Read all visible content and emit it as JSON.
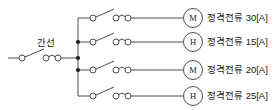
{
  "diagram": {
    "stroke_color": "#3a3a3a",
    "text_color": "#1a1a1a",
    "background": "#ffffff",
    "bus_label": "간선",
    "branches": [
      {
        "symbol": "M",
        "symbol_meaning": "motor",
        "label_prefix": "정격전류",
        "current": "30",
        "unit": "[A]",
        "label_full": "정격전류 30[A]"
      },
      {
        "symbol": "H",
        "symbol_meaning": "heater",
        "label_prefix": "정격전류",
        "current": "15",
        "unit": "[A]",
        "label_full": "정격전류 15[A]"
      },
      {
        "symbol": "M",
        "symbol_meaning": "motor",
        "label_prefix": "정격전류",
        "current": "20",
        "unit": "[A]",
        "label_full": "정격전류 20[A]"
      },
      {
        "symbol": "H",
        "symbol_meaning": "heater",
        "label_prefix": "정격전류",
        "current": "25",
        "unit": "[A]",
        "label_full": "정격전류 25[A]"
      }
    ]
  }
}
